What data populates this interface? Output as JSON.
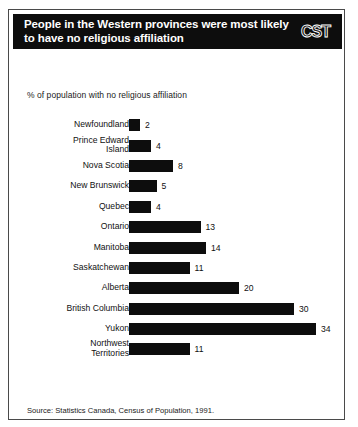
{
  "header": {
    "title": "People in the Western provinces were most likely\nto have no religious affiliation",
    "logo": "CST"
  },
  "subtitle": "% of population with no religious affiliation",
  "source": "Source: Statistics Canada, Census of Population, 1991.",
  "colors": {
    "bar": "#0d0d0d",
    "banner_background": "#0d0d0d",
    "banner_text": "#ffffff",
    "page_background": "#ffffff",
    "frame_border": "#4a4a4a"
  },
  "chart_data": {
    "type": "bar",
    "orientation": "horizontal",
    "title": "People in the Western provinces were most likely to have no religious affiliation",
    "subtitle": "% of population with no religious affiliation",
    "xlabel": "",
    "ylabel": "",
    "xlim": [
      0,
      34
    ],
    "grid": false,
    "legend": false,
    "data_labels": true,
    "source": "Source: Statistics Canada, Census of Population, 1991.",
    "categories": [
      "Newfoundland",
      "Prince Edward\nIsland",
      "Nova Scotia",
      "New Brunswick",
      "Quebec",
      "Ontario",
      "Manitoba",
      "Saskatchewan",
      "Alberta",
      "British Columbia",
      "Yukon",
      "Northwest\nTerritories"
    ],
    "values": [
      2,
      4,
      8,
      5,
      4,
      13,
      14,
      11,
      20,
      30,
      34,
      11
    ],
    "value_labels": [
      "2",
      "4",
      "8",
      "5",
      "4",
      "13",
      "14",
      "11",
      "20",
      "30",
      "34",
      "11"
    ]
  }
}
